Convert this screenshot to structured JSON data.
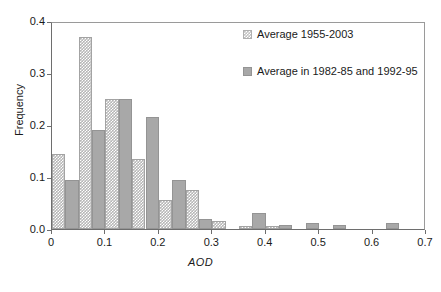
{
  "chart_data": {
    "type": "bar",
    "title": "",
    "xlabel": "AOD",
    "ylabel": "Frequency",
    "xlim": [
      0,
      0.7
    ],
    "ylim": [
      0,
      0.4
    ],
    "xticks": [
      "0",
      "0.1",
      "0.2",
      "0.3",
      "0.4",
      "0.5",
      "0.6",
      "0.7"
    ],
    "xtick_values": [
      0,
      0.1,
      0.2,
      0.3,
      0.4,
      0.5,
      0.6,
      0.7
    ],
    "yticks": [
      "0.0",
      "0.1",
      "0.2",
      "0.3",
      "0.4"
    ],
    "ytick_values": [
      0.0,
      0.1,
      0.2,
      0.3,
      0.4
    ],
    "grid": false,
    "legend_position": "upper right",
    "bin_width": 0.025,
    "series": [
      {
        "name": "Average 1955-2003",
        "style": "hatched",
        "color": "#b6b6b6",
        "bin_starts": [
          0.0,
          0.05,
          0.1,
          0.15,
          0.2,
          0.25,
          0.3,
          0.35,
          0.4,
          0.45,
          0.5,
          0.55,
          0.6
        ],
        "values": [
          0.145,
          0.37,
          0.25,
          0.135,
          0.055,
          0.075,
          0.015,
          0.005,
          0.005,
          0.0,
          0.0,
          0.0,
          0.0
        ]
      },
      {
        "name": "Average in 1982-85 and 1992-95",
        "style": "solid",
        "color": "#a8a8a8",
        "bin_starts": [
          0.025,
          0.075,
          0.125,
          0.175,
          0.225,
          0.275,
          0.325,
          0.375,
          0.425,
          0.475,
          0.525,
          0.575,
          0.625
        ],
        "values": [
          0.095,
          0.19,
          0.25,
          0.215,
          0.095,
          0.02,
          0.0,
          0.03,
          0.008,
          0.012,
          0.008,
          0.0,
          0.012
        ]
      }
    ]
  },
  "legend": {
    "entries": [
      {
        "label": "Average 1955-2003"
      },
      {
        "label": "Average in 1982-85 and 1992-95"
      }
    ]
  }
}
